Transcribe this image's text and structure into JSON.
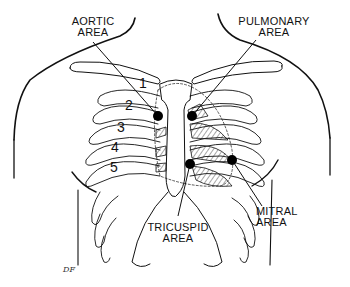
{
  "diagram": {
    "labels": {
      "aortic": "AORTIC\nAREA",
      "aortic_line1": "AORTIC",
      "aortic_line2": "AREA",
      "pulmonary_line1": "PULMONARY",
      "pulmonary_line2": "AREA",
      "tricuspid_line1": "TRICUSPID",
      "tricuspid_line2": "AREA",
      "mitral_line1": "MITRAL",
      "mitral_line2": "AREA"
    },
    "rib_numbers": [
      "1",
      "2",
      "3",
      "4",
      "5"
    ],
    "signature": "DF",
    "colors": {
      "ink": "#111111",
      "background": "#ffffff"
    }
  }
}
